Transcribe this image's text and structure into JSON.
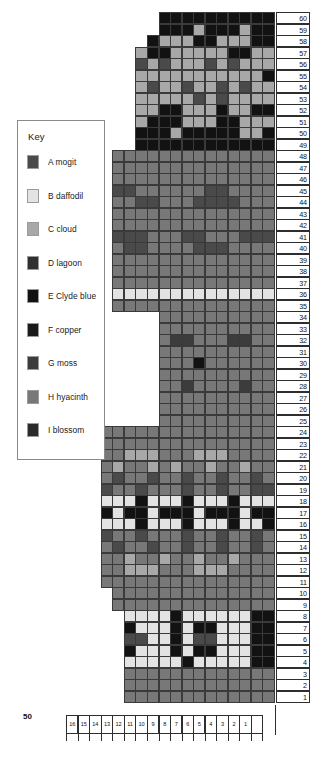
{
  "key": {
    "title": "Key",
    "items": [
      {
        "code": "A",
        "name": "A mogit",
        "color": "#4a4a4a"
      },
      {
        "code": "B",
        "name": "B daffodil",
        "color": "#e3e3e3"
      },
      {
        "code": "C",
        "name": "C cloud",
        "color": "#a8a8a8"
      },
      {
        "code": "D",
        "name": "D lagoon",
        "color": "#303030"
      },
      {
        "code": "E",
        "name": "E Clyde blue",
        "color": "#121212"
      },
      {
        "code": "F",
        "name": "F copper",
        "color": "#1a1a1a"
      },
      {
        "code": "G",
        "name": "G moss",
        "color": "#3c3c3c"
      },
      {
        "code": "H",
        "name": "H hyacinth",
        "color": "#787878"
      },
      {
        "code": "I",
        "name": "I blossom",
        "color": "#2a2a2a"
      }
    ]
  },
  "corner_label": "50",
  "axes": {
    "row_numbers": [
      60,
      59,
      58,
      57,
      56,
      55,
      54,
      53,
      52,
      51,
      50,
      49,
      48,
      47,
      46,
      45,
      44,
      43,
      42,
      41,
      40,
      39,
      38,
      37,
      36,
      35,
      34,
      33,
      32,
      31,
      30,
      29,
      28,
      27,
      26,
      25,
      24,
      23,
      22,
      21,
      20,
      19,
      18,
      17,
      16,
      15,
      14,
      13,
      12,
      11,
      10,
      9,
      8,
      7,
      6,
      5,
      4,
      3,
      2,
      1
    ],
    "column_numbers": [
      16,
      15,
      14,
      13,
      12,
      11,
      10,
      9,
      8,
      7,
      6,
      5,
      4,
      3,
      2,
      1
    ]
  },
  "chart_data": {
    "type": "heatmap",
    "xlabel": "",
    "ylabel": "",
    "palette": {
      "A": "#4a4a4a",
      "B": "#e3e3e3",
      "C": "#a8a8a8",
      "D": "#303030",
      "E": "#121212",
      "F": "#1a1a1a",
      "G": "#3c3c3c",
      "H": "#787878",
      "I": "#2a2a2a",
      "_": null
    },
    "columns": 16,
    "rows": 60,
    "note": "Rows listed top (60) to bottom (1); each string is 16 cells left-to-right. '_' = empty / no stitch.",
    "grid": [
      "______EEEEEEEEEE",
      "______EEECEEECEE",
      "_____ECCCEECCCEE",
      "____CEECCCCCEECC",
      "____ACACCCACACCC",
      "____CCCCCCCCCCCE",
      "____CACCACCACACC",
      "____CCCCCACACCCC",
      "____CCEECCCECCEE",
      "____CEEECCCEECCC",
      "____EEECEEEEECCE",
      "____EEEEEEEEEEEE",
      "__HHHHHHHHHHHHHH",
      "__HHHHHHHHHHHHHH",
      "__HHHHHHHHHHHHHH",
      "__AAHHHHHHAAHHHH",
      "__HHAAHHHAAAAHHH",
      "__HHHHHHHHHHHHHH",
      "__HHHHHHHHHHHHHH",
      "__AAAHHHAAHHHAAA",
      "__HAAHHHHAAAHHHH",
      "__HHHHHHHHHHHHHH",
      "__HHHHHHHHHHHHHH",
      "__HHHHHHHHHHHHHH",
      "__BBBBBBBBBBBBBB",
      "__HHHHHHHHHHHHHH",
      "______HHHHHHHHHH",
      "______HHHHHHHHHH",
      "______HGGHHHGGHH",
      "______HHHHHHHHHH",
      "______HHHEHHHHHH",
      "______HHHHHHHHHH",
      "______HHGHHHHGHH",
      "______HHHHHHHHHH",
      "______HHHHHHHHHH",
      "______HHHHHHHHHH",
      "_HHHHHHHHHHHHHHH",
      "_HHHHHHHHHHHHHHH",
      "_HHCCCHHHCCCHHHH",
      "_HCHHCHCHHCHHCHH",
      "_HAHHAHHAHHAHHAH",
      "_AHHAHHHAHHAHHAA",
      "_BBBEBBBEBBBEBBB",
      "_EBEEBEEEBEEEBEE",
      "_BBBEBBBEBBBEBBE",
      "_AHHAHHHAHHAHHAH",
      "_HAHHAHHAHHAHHAH",
      "_HHCHHCHHCHHCHHH",
      "_HHCCCHHHCCCHHHH",
      "_HHHHHHHHHHHHHHH",
      "__HHHHHHHHHHHHHH",
      "__HHHHHHHHHHHHHH",
      "___BBBBEBBBBBBEE",
      "___EBBBEBEEBBBEE",
      "___AABBEBAABBBEE",
      "___EBBBEBEEBBBEE",
      "___BBBBBEBBBBBEE",
      "___HHHHHHHHHHHHH",
      "___HHHHHHHHHHHHH",
      "___HHHHHHHHHHHHH"
    ]
  }
}
